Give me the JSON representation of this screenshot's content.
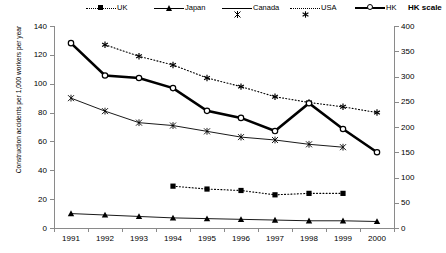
{
  "legend": {
    "items": [
      {
        "label": "UK",
        "marker": "square",
        "line": "dotted",
        "x": 86
      },
      {
        "label": "Japan",
        "marker": "tri",
        "line": "solid",
        "x": 154
      },
      {
        "label": "Canada",
        "marker": "starx",
        "line": "solid",
        "x": 222
      },
      {
        "label": "USA",
        "marker": "astk",
        "line": "dotted",
        "x": 290
      },
      {
        "label": "HK",
        "marker": "circ",
        "line": "thick",
        "x": 355
      }
    ],
    "hk_scale_label": "HK scale"
  },
  "axes": {
    "y_left_title": "Construction accidents per 1,000 workers per year",
    "y_left_ticks": [
      "0",
      "20",
      "40",
      "60",
      "80",
      "100",
      "120",
      "140"
    ],
    "y_right_ticks": [
      "0",
      "50",
      "100",
      "150",
      "200",
      "250",
      "300",
      "350",
      "400"
    ],
    "x_ticks": [
      "1991",
      "1992",
      "1993",
      "1994",
      "1995",
      "1996",
      "1997",
      "1998",
      "1999",
      "2000"
    ]
  },
  "chart_data": {
    "type": "line",
    "title": "",
    "xlabel": "",
    "ylabel": "Construction accidents per 1,000 workers per year",
    "y2label": "HK scale",
    "ylim": [
      0,
      140
    ],
    "y2lim": [
      0,
      400
    ],
    "grid": false,
    "legend_position": "top",
    "categories": [
      "1991",
      "1992",
      "1993",
      "1994",
      "1995",
      "1996",
      "1997",
      "1998",
      "1999",
      "2000"
    ],
    "series": [
      {
        "name": "UK",
        "axis": "left",
        "marker": "square",
        "line": "dotted",
        "values": [
          null,
          null,
          null,
          29,
          27,
          26,
          23,
          24,
          24,
          null
        ]
      },
      {
        "name": "Japan",
        "axis": "left",
        "marker": "triangle",
        "line": "solid",
        "values": [
          10,
          9,
          8,
          7,
          6.5,
          6,
          5.5,
          5,
          5,
          4.5
        ]
      },
      {
        "name": "Canada",
        "axis": "left",
        "marker": "cross",
        "line": "solid",
        "values": [
          90,
          81,
          73,
          71,
          67,
          63,
          61,
          58,
          56,
          null
        ]
      },
      {
        "name": "USA",
        "axis": "left",
        "marker": "asterisk",
        "line": "dotted",
        "values": [
          null,
          127,
          119,
          113,
          104,
          98,
          91,
          87,
          84,
          80
        ]
      },
      {
        "name": "HK",
        "axis": "right",
        "marker": "circle",
        "line": "thick",
        "values": [
          366,
          302,
          297,
          277,
          232,
          218,
          192,
          247,
          196,
          150
        ]
      }
    ],
    "series_left_equivalent": {
      "HK_left_scale_values": [
        128,
        105.7,
        104,
        97,
        81,
        76,
        67,
        86.5,
        68.5,
        52.5
      ]
    }
  }
}
